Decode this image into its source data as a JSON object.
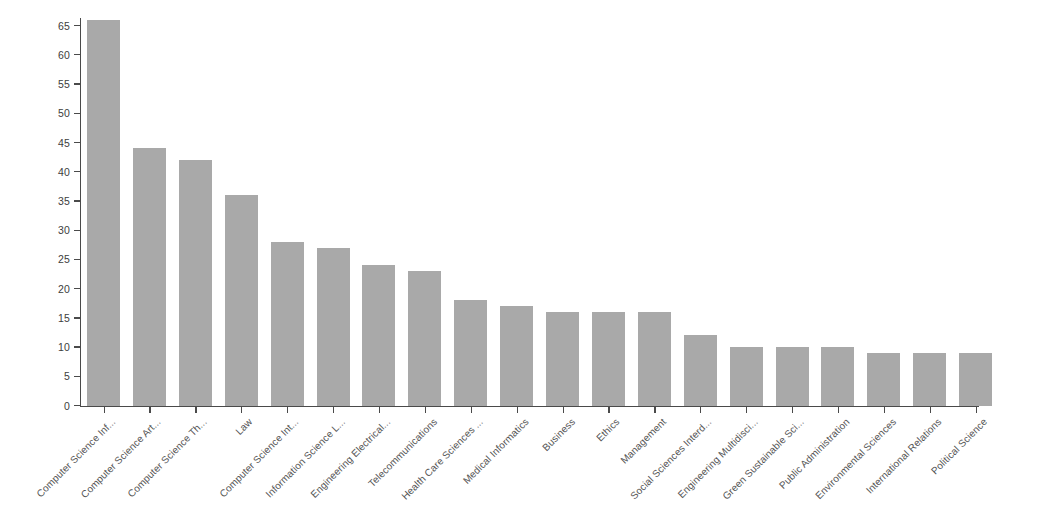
{
  "chart_data": {
    "type": "bar",
    "title": "",
    "subtitle": "",
    "xlabel": "",
    "ylabel": "",
    "ylim": [
      0,
      66
    ],
    "grid": false,
    "legend": "none",
    "bar_color": "#a9a9a9",
    "axis_color": "#4a4a4a",
    "background_color": "#ffffff",
    "label_rotation_deg": -45,
    "ytick_labels": [
      "0",
      "5",
      "10",
      "15",
      "20",
      "25",
      "30",
      "35",
      "40",
      "45",
      "50",
      "55",
      "60",
      "65"
    ],
    "ytick_values": [
      0,
      5,
      10,
      15,
      20,
      25,
      30,
      35,
      40,
      45,
      50,
      55,
      60,
      65
    ],
    "categories": [
      "Computer Science Inf...",
      "Computer Science Art...",
      "Computer Science Th...",
      "Law",
      "Computer Science Int...",
      "Information Science L...",
      "Engineering Electrical...",
      "Telecommunications",
      "Health Care Sciences ...",
      "Medical Informatics",
      "Business",
      "Ethics",
      "Management",
      "Social Sciences Interd...",
      "Engineering Multidisci...",
      "Green Sustainable Sci...",
      "Public Administration",
      "Environmental Sciences",
      "International Relations",
      "Political Science"
    ],
    "values": [
      66,
      44,
      42,
      36,
      28,
      27,
      24,
      23,
      18,
      17,
      16,
      16,
      16,
      12,
      10,
      10,
      10,
      9,
      9,
      9
    ]
  }
}
